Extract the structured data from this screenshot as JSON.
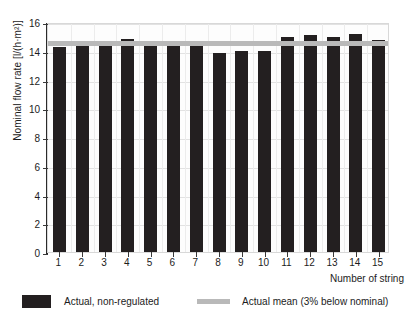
{
  "chart_data": {
    "type": "bar",
    "title": "",
    "xlabel": "Number of string",
    "ylabel": "Nominal flow rate [l/(h·m²)]",
    "categories": [
      "1",
      "2",
      "3",
      "4",
      "5",
      "6",
      "7",
      "8",
      "9",
      "10",
      "11",
      "12",
      "13",
      "14",
      "15"
    ],
    "series": [
      {
        "name": "Actual, non-regulated",
        "values": [
          14.25,
          14.35,
          14.55,
          14.85,
          14.55,
          14.45,
          14.3,
          13.85,
          13.95,
          13.95,
          14.95,
          15.1,
          14.95,
          15.2,
          14.75
        ]
      }
    ],
    "reference_lines": [
      {
        "name": "Actual mean (3% below nominal)",
        "value": 14.65,
        "color": "#b9b9b9"
      }
    ],
    "ylim": [
      0,
      16
    ],
    "yticks": [
      "0",
      "2",
      "4",
      "6",
      "8",
      "10",
      "12",
      "14",
      "16"
    ],
    "grid": true,
    "legend_position": "bottom",
    "bar_color": "#231f20"
  },
  "legend": {
    "bar_label": "Actual, non-regulated",
    "mean_label": "Actual mean (3% below nominal)"
  }
}
